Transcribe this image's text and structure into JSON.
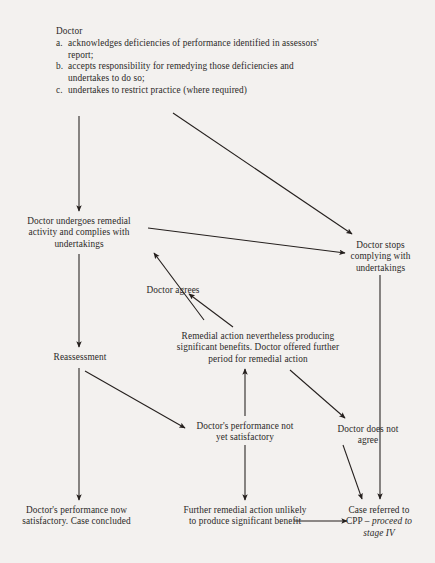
{
  "diagram": {
    "line_color": "#241f1d",
    "text_color": "#2b2927",
    "background_color": "#f3f1ef",
    "nodes": {
      "doctor_list": {
        "heading": "Doctor",
        "items": [
          {
            "marker": "a.",
            "text": "acknowledges deficiencies of performance identified in assessors' report;"
          },
          {
            "marker": "b.",
            "text": "accepts responsibility for remedying those deficiencies and undertakes to do so;"
          },
          {
            "marker": "c.",
            "text": "undertakes to restrict practice (where required)"
          }
        ]
      },
      "undergoes_remedial": "Doctor undergoes remedial activity and complies with undertakings",
      "reassessment": "Reassessment",
      "now_satisfactory": "Doctor's performance now satisfactory. Case concluded",
      "doctor_agrees": "Doctor agrees",
      "remedial_benefits": "Remedial action nevertheless producing significant benefits. Doctor offered further period for remedial action",
      "not_yet_satisfactory": "Doctor's performance not yet satisfactory",
      "further_remedial": "Further remedial action unlikely to produce significant benefit",
      "stops_complying": "Doctor stops complying with undertakings",
      "does_not_agree": "Doctor does not agree",
      "cpp_referral_line1": "Case referred to",
      "cpp_referral_line2": "CPP – ",
      "cpp_referral_italic1": "proceed to",
      "cpp_referral_italic2": "stage IV"
    },
    "edges": [
      {
        "name": "doctor-list-to-undergoes",
        "from": "doctor_list",
        "to": "undergoes_remedial"
      },
      {
        "name": "doctor-list-to-stops-complying",
        "from": "doctor_list",
        "to": "stops_complying"
      },
      {
        "name": "undergoes-to-stops-complying",
        "from": "undergoes_remedial",
        "to": "stops_complying"
      },
      {
        "name": "undergoes-to-reassessment",
        "from": "undergoes_remedial",
        "to": "reassessment"
      },
      {
        "name": "doctor-agrees-to-undergoes",
        "from": "doctor_agrees",
        "to": "undergoes_remedial"
      },
      {
        "name": "remedial-benefits-to-doctor-agrees",
        "from": "remedial_benefits",
        "to": "doctor_agrees"
      },
      {
        "name": "reassessment-to-now-satisfactory",
        "from": "reassessment",
        "to": "now_satisfactory"
      },
      {
        "name": "reassessment-to-not-yet-satisfactory",
        "from": "reassessment",
        "to": "not_yet_satisfactory"
      },
      {
        "name": "reassessment-to-does-not-agree",
        "from": "reassessment",
        "to": "does_not_agree"
      },
      {
        "name": "not-yet-satisfactory-to-remedial-benefits",
        "from": "not_yet_satisfactory",
        "to": "remedial_benefits"
      },
      {
        "name": "not-yet-satisfactory-to-further-remedial",
        "from": "not_yet_satisfactory",
        "to": "further_remedial"
      },
      {
        "name": "further-remedial-to-cpp",
        "from": "further_remedial",
        "to": "cpp_referral"
      },
      {
        "name": "does-not-agree-to-cpp",
        "from": "does_not_agree",
        "to": "cpp_referral"
      },
      {
        "name": "stops-complying-to-cpp",
        "from": "stops_complying",
        "to": "cpp_referral"
      }
    ]
  }
}
